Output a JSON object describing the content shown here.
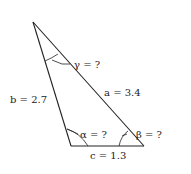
{
  "triangle": {
    "sides": {
      "a": "a = 3.4",
      "b": "b = 2.7",
      "c": "c = 1.3"
    },
    "angles": {
      "alpha": "α = ?",
      "beta": "β = ?",
      "gamma": "γ = ?"
    }
  },
  "colors": {
    "line": "#222222",
    "background": "#ffffff"
  }
}
